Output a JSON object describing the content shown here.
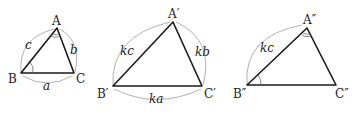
{
  "diagram": {
    "type": "similar-triangles",
    "colors": {
      "edge": "#1a1a1a",
      "arc": "#a8a8a8",
      "text": "#222222"
    },
    "triangles": [
      {
        "id": "ABC",
        "vertices": {
          "A": "A",
          "B": "B",
          "C": "C"
        },
        "sides": {
          "AB": "c",
          "AC": "b",
          "BC": "a"
        },
        "marked_angles": [
          "A",
          "B"
        ]
      },
      {
        "id": "A'B'C'",
        "vertices": {
          "A": "A′",
          "B": "B′",
          "C": "C′"
        },
        "sides": {
          "AB": "kc",
          "AC": "kb",
          "BC": "ka"
        },
        "marked_angles": []
      },
      {
        "id": "A''B''C''",
        "vertices": {
          "A": "A″",
          "B": "B″",
          "C": "C″"
        },
        "sides": {
          "AB": "kc"
        },
        "marked_angles": [
          "A",
          "B"
        ]
      }
    ]
  }
}
